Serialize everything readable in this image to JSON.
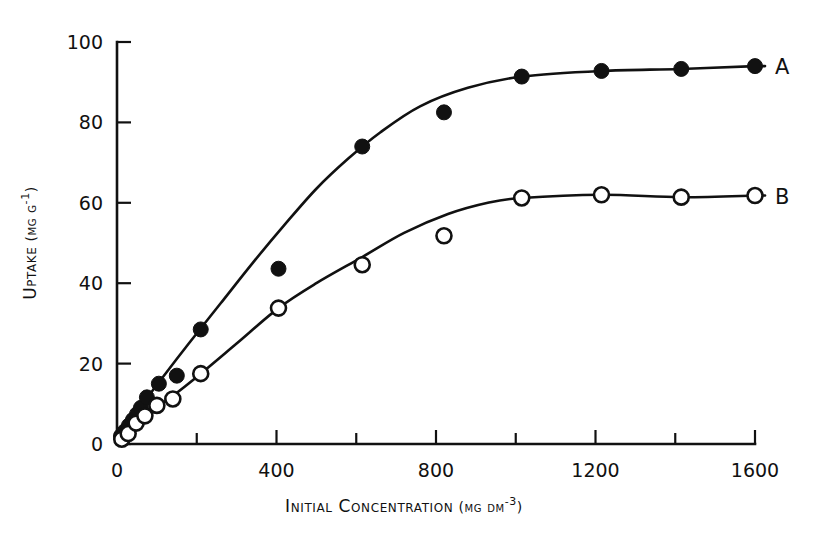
{
  "chart_data": {
    "type": "scatter",
    "title": "",
    "xlabel": "Initial Concentration (mg dm-3)",
    "xlabel_parts": {
      "main": "Initial Concentration",
      "unit_open": " (",
      "unit": "mg dm",
      "exp": "-3",
      "unit_close": ")"
    },
    "ylabel": "Uptake (mg g-1)",
    "ylabel_parts": {
      "main": "Uptake",
      "unit_open": " (",
      "unit": "mg g",
      "exp": "-1",
      "unit_close": ")"
    },
    "xlim": [
      0,
      1600
    ],
    "ylim": [
      0,
      100
    ],
    "xticks": [
      0,
      200,
      400,
      600,
      800,
      1000,
      1200,
      1400,
      1600
    ],
    "xtick_labels": [
      "0",
      "",
      "400",
      "",
      "800",
      "",
      "1200",
      "",
      "1600"
    ],
    "yticks": [
      0,
      20,
      40,
      60,
      80,
      100
    ],
    "ytick_labels": [
      "0",
      "20",
      "40",
      "60",
      "80",
      "100"
    ],
    "grid": false,
    "legend_position": "right-inline",
    "series": [
      {
        "name": "A",
        "label": "A",
        "marker": "filled-circle",
        "points": [
          {
            "x": 10,
            "y": 2.0
          },
          {
            "x": 20,
            "y": 3.2
          },
          {
            "x": 30,
            "y": 4.6
          },
          {
            "x": 40,
            "y": 6.0
          },
          {
            "x": 50,
            "y": 7.4
          },
          {
            "x": 60,
            "y": 9.0
          },
          {
            "x": 75,
            "y": 11.6
          },
          {
            "x": 105,
            "y": 15.0
          },
          {
            "x": 150,
            "y": 17.0
          },
          {
            "x": 210,
            "y": 28.5
          },
          {
            "x": 405,
            "y": 43.6
          },
          {
            "x": 615,
            "y": 74.0
          },
          {
            "x": 820,
            "y": 82.5
          },
          {
            "x": 1015,
            "y": 91.4
          },
          {
            "x": 1215,
            "y": 92.8
          },
          {
            "x": 1415,
            "y": 93.3
          },
          {
            "x": 1600,
            "y": 94.0
          }
        ]
      },
      {
        "name": "B",
        "label": "B",
        "marker": "open-circle",
        "points": [
          {
            "x": 12,
            "y": 1.2
          },
          {
            "x": 28,
            "y": 2.6
          },
          {
            "x": 48,
            "y": 5.2
          },
          {
            "x": 70,
            "y": 7.0
          },
          {
            "x": 100,
            "y": 9.6
          },
          {
            "x": 140,
            "y": 11.2
          },
          {
            "x": 210,
            "y": 17.5
          },
          {
            "x": 405,
            "y": 33.8
          },
          {
            "x": 615,
            "y": 44.6
          },
          {
            "x": 820,
            "y": 51.8
          },
          {
            "x": 1015,
            "y": 61.2
          },
          {
            "x": 1215,
            "y": 62.0
          },
          {
            "x": 1415,
            "y": 61.4
          },
          {
            "x": 1600,
            "y": 61.8
          }
        ]
      }
    ],
    "fitted_curves": [
      {
        "name": "A",
        "path": [
          {
            "x": 0,
            "y": 0
          },
          {
            "x": 40,
            "y": 6.0
          },
          {
            "x": 80,
            "y": 12.0
          },
          {
            "x": 120,
            "y": 17.3
          },
          {
            "x": 180,
            "y": 25.0
          },
          {
            "x": 260,
            "y": 35.0
          },
          {
            "x": 340,
            "y": 45.0
          },
          {
            "x": 420,
            "y": 54.5
          },
          {
            "x": 500,
            "y": 63.5
          },
          {
            "x": 580,
            "y": 71.0
          },
          {
            "x": 660,
            "y": 77.5
          },
          {
            "x": 760,
            "y": 84.0
          },
          {
            "x": 880,
            "y": 88.6
          },
          {
            "x": 1015,
            "y": 91.4
          },
          {
            "x": 1215,
            "y": 92.8
          },
          {
            "x": 1415,
            "y": 93.3
          },
          {
            "x": 1600,
            "y": 94.0
          }
        ]
      },
      {
        "name": "B",
        "path": [
          {
            "x": 0,
            "y": 0
          },
          {
            "x": 40,
            "y": 4.0
          },
          {
            "x": 80,
            "y": 7.8
          },
          {
            "x": 140,
            "y": 12.0
          },
          {
            "x": 210,
            "y": 17.5
          },
          {
            "x": 300,
            "y": 25.0
          },
          {
            "x": 405,
            "y": 33.8
          },
          {
            "x": 500,
            "y": 40.0
          },
          {
            "x": 615,
            "y": 46.5
          },
          {
            "x": 720,
            "y": 52.5
          },
          {
            "x": 830,
            "y": 57.2
          },
          {
            "x": 930,
            "y": 60.0
          },
          {
            "x": 1015,
            "y": 61.2
          },
          {
            "x": 1215,
            "y": 62.0
          },
          {
            "x": 1415,
            "y": 61.4
          },
          {
            "x": 1600,
            "y": 61.8
          }
        ]
      }
    ]
  },
  "geometry": {
    "x0_px": 117,
    "x1_px": 755,
    "y0_px": 444,
    "y1_px": 42,
    "marker_filled_r": 7.5,
    "marker_open_r": 7.5,
    "tick_len_major": 14,
    "tick_len_minor": 11
  },
  "labels": {
    "series_a": "A",
    "series_b": "B"
  }
}
